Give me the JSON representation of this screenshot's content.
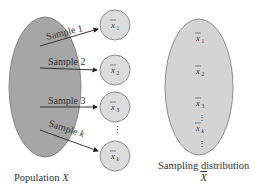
{
  "population": {
    "label": "Population",
    "variable": "X",
    "fill": "#a6a6a6"
  },
  "samples": [
    {
      "label": "Sample",
      "index": "1",
      "mean": "x",
      "sub": "1"
    },
    {
      "label": "Sample",
      "index": "2",
      "mean": "x",
      "sub": "2"
    },
    {
      "label": "Sample",
      "index": "3",
      "mean": "x",
      "sub": "3"
    },
    {
      "label": "Sample",
      "index": "k",
      "mean": "x",
      "sub": "k"
    }
  ],
  "circle_fill": "#dcdcdc",
  "sampling_distribution": {
    "label": "Sampling distribution",
    "variable": "X",
    "fill": "#d4d4d4",
    "items": [
      {
        "mean": "x",
        "sub": "1"
      },
      {
        "mean": "x",
        "sub": "2"
      },
      {
        "mean": "x",
        "sub": "3"
      },
      {
        "mean": "x",
        "sub": "k"
      }
    ]
  },
  "ellipsis": "⋮"
}
